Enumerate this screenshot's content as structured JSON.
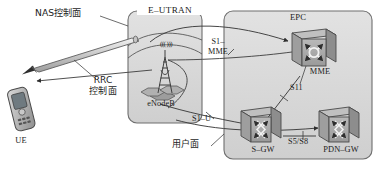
{
  "diagram": {
    "type": "network-architecture",
    "background": "#ffffff",
    "region_fill": "#d8d8d8",
    "region_stroke": "#6e6e6e",
    "node_fill": "#a8a8a8",
    "node_stroke": "#4a4a4a",
    "line_color": "#3c3c3c"
  },
  "regions": [
    {
      "id": "e-utran",
      "label": "E–UTRAN",
      "x": 128,
      "y": 11,
      "w": 74,
      "h": 112
    },
    {
      "id": "epc",
      "label": "EPC",
      "x": 224,
      "y": 11,
      "w": 148,
      "h": 148
    }
  ],
  "nodes": [
    {
      "id": "ue",
      "label": "UE",
      "icon": "mobile-handset-icon"
    },
    {
      "id": "enodeb",
      "label": "eNodeB",
      "icon": "cell-tower-icon",
      "signal": "((( )))"
    },
    {
      "id": "mme",
      "label": "MME",
      "icon": "mme-node-icon"
    },
    {
      "id": "sgw",
      "label": "S–GW",
      "icon": "gateway-node-icon"
    },
    {
      "id": "pdngw",
      "label": "PDN–GW",
      "icon": "gateway-node-icon"
    }
  ],
  "interfaces": [
    {
      "id": "s1-mme",
      "label_line1": "S1–",
      "label_line2": "MME"
    },
    {
      "id": "s11",
      "label": "S11"
    },
    {
      "id": "s1-u",
      "label": "S1–U"
    },
    {
      "id": "s5-s8",
      "label": "S5/S8"
    }
  ],
  "planes": [
    {
      "id": "nas",
      "label": "NAS控制面"
    },
    {
      "id": "rrc",
      "label_line1": "RRC",
      "label_line2": "控制面"
    },
    {
      "id": "user-plane",
      "label": "用户面"
    }
  ]
}
